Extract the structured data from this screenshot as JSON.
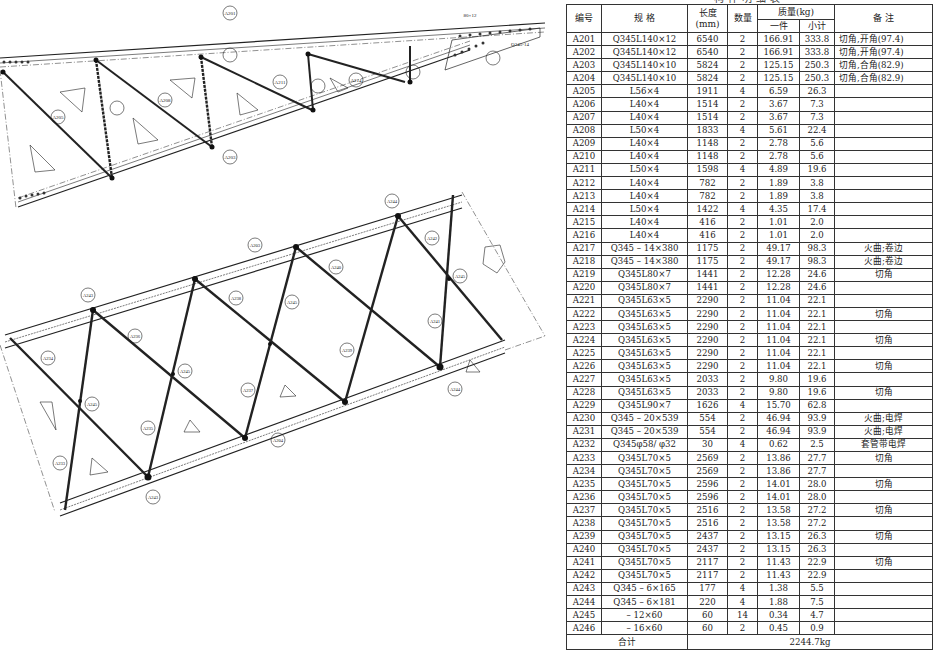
{
  "table": {
    "title": "构件明细表",
    "headers": {
      "id": "编号",
      "spec": "规  格",
      "length": "长度",
      "length_unit": "(mm)",
      "qty": "数量",
      "mass": "质量(kg)",
      "mass_each": "一件",
      "mass_subtotal": "小计",
      "note": "备  注"
    },
    "rows": [
      {
        "id": "A201",
        "spec": "Q345L140×12",
        "length": "6540",
        "qty": "2",
        "each": "166.91",
        "sub": "333.8",
        "note": "切角,开角(97.4)"
      },
      {
        "id": "A202",
        "spec": "Q345L140×12",
        "length": "6540",
        "qty": "2",
        "each": "166.91",
        "sub": "333.8",
        "note": "切角,开角(97.4)"
      },
      {
        "id": "A203",
        "spec": "Q345L140×10",
        "length": "5824",
        "qty": "2",
        "each": "125.15",
        "sub": "250.3",
        "note": "切角,合角(82.9)"
      },
      {
        "id": "A204",
        "spec": "Q345L140×10",
        "length": "5824",
        "qty": "2",
        "each": "125.15",
        "sub": "250.3",
        "note": "切角,合角(82.9)"
      },
      {
        "id": "A205",
        "spec": "L56×4",
        "length": "1911",
        "qty": "4",
        "each": "6.59",
        "sub": "26.3",
        "note": ""
      },
      {
        "id": "A206",
        "spec": "L40×4",
        "length": "1514",
        "qty": "2",
        "each": "3.67",
        "sub": "7.3",
        "note": ""
      },
      {
        "id": "A207",
        "spec": "L40×4",
        "length": "1514",
        "qty": "2",
        "each": "3.67",
        "sub": "7.3",
        "note": ""
      },
      {
        "id": "A208",
        "spec": "L50×4",
        "length": "1833",
        "qty": "4",
        "each": "5.61",
        "sub": "22.4",
        "note": ""
      },
      {
        "id": "A209",
        "spec": "L40×4",
        "length": "1148",
        "qty": "2",
        "each": "2.78",
        "sub": "5.6",
        "note": ""
      },
      {
        "id": "A210",
        "spec": "L40×4",
        "length": "1148",
        "qty": "2",
        "each": "2.78",
        "sub": "5.6",
        "note": ""
      },
      {
        "id": "A211",
        "spec": "L50×4",
        "length": "1598",
        "qty": "4",
        "each": "4.89",
        "sub": "19.6",
        "note": ""
      },
      {
        "id": "A212",
        "spec": "L40×4",
        "length": "782",
        "qty": "2",
        "each": "1.89",
        "sub": "3.8",
        "note": ""
      },
      {
        "id": "A213",
        "spec": "L40×4",
        "length": "782",
        "qty": "2",
        "each": "1.89",
        "sub": "3.8",
        "note": ""
      },
      {
        "id": "A214",
        "spec": "L50×4",
        "length": "1422",
        "qty": "4",
        "each": "4.35",
        "sub": "17.4",
        "note": ""
      },
      {
        "id": "A215",
        "spec": "L40×4",
        "length": "416",
        "qty": "2",
        "each": "1.01",
        "sub": "2.0",
        "note": ""
      },
      {
        "id": "A216",
        "spec": "L40×4",
        "length": "416",
        "qty": "2",
        "each": "1.01",
        "sub": "2.0",
        "note": ""
      },
      {
        "id": "A217",
        "spec": "Q345 – 14×380",
        "length": "1175",
        "qty": "2",
        "each": "49.17",
        "sub": "98.3",
        "note": "火曲;卷边"
      },
      {
        "id": "A218",
        "spec": "Q345 – 14×380",
        "length": "1175",
        "qty": "2",
        "each": "49.17",
        "sub": "98.3",
        "note": "火曲;卷边"
      },
      {
        "id": "A219",
        "spec": "Q345L80×7",
        "length": "1441",
        "qty": "2",
        "each": "12.28",
        "sub": "24.6",
        "note": "切角"
      },
      {
        "id": "A220",
        "spec": "Q345L80×7",
        "length": "1441",
        "qty": "2",
        "each": "12.28",
        "sub": "24.6",
        "note": ""
      },
      {
        "id": "A221",
        "spec": "Q345L63×5",
        "length": "2290",
        "qty": "2",
        "each": "11.04",
        "sub": "22.1",
        "note": ""
      },
      {
        "id": "A222",
        "spec": "Q345L63×5",
        "length": "2290",
        "qty": "2",
        "each": "11.04",
        "sub": "22.1",
        "note": "切角"
      },
      {
        "id": "A223",
        "spec": "Q345L63×5",
        "length": "2290",
        "qty": "2",
        "each": "11.04",
        "sub": "22.1",
        "note": ""
      },
      {
        "id": "A224",
        "spec": "Q345L63×5",
        "length": "2290",
        "qty": "2",
        "each": "11.04",
        "sub": "22.1",
        "note": "切角"
      },
      {
        "id": "A225",
        "spec": "Q345L63×5",
        "length": "2290",
        "qty": "2",
        "each": "11.04",
        "sub": "22.1",
        "note": ""
      },
      {
        "id": "A226",
        "spec": "Q345L63×5",
        "length": "2290",
        "qty": "2",
        "each": "11.04",
        "sub": "22.1",
        "note": "切角"
      },
      {
        "id": "A227",
        "spec": "Q345L63×5",
        "length": "2033",
        "qty": "2",
        "each": "9.80",
        "sub": "19.6",
        "note": ""
      },
      {
        "id": "A228",
        "spec": "Q345L63×5",
        "length": "2033",
        "qty": "2",
        "each": "9.80",
        "sub": "19.6",
        "note": "切角"
      },
      {
        "id": "A229",
        "spec": "Q345L90×7",
        "length": "1626",
        "qty": "4",
        "each": "15.70",
        "sub": "62.8",
        "note": ""
      },
      {
        "id": "A230",
        "spec": "Q345 – 20×539",
        "length": "554",
        "qty": "2",
        "each": "46.94",
        "sub": "93.9",
        "note": "火曲;电焊"
      },
      {
        "id": "A231",
        "spec": "Q345 – 20×539",
        "length": "554",
        "qty": "2",
        "each": "46.94",
        "sub": "93.9",
        "note": "火曲;电焊"
      },
      {
        "id": "A232",
        "spec": "Q345φ58/ φ32",
        "length": "30",
        "qty": "4",
        "each": "0.62",
        "sub": "2.5",
        "note": "套管带电焊"
      },
      {
        "id": "A233",
        "spec": "Q345L70×5",
        "length": "2569",
        "qty": "2",
        "each": "13.86",
        "sub": "27.7",
        "note": "切角"
      },
      {
        "id": "A234",
        "spec": "Q345L70×5",
        "length": "2569",
        "qty": "2",
        "each": "13.86",
        "sub": "27.7",
        "note": ""
      },
      {
        "id": "A235",
        "spec": "Q345L70×5",
        "length": "2596",
        "qty": "2",
        "each": "14.01",
        "sub": "28.0",
        "note": "切角"
      },
      {
        "id": "A236",
        "spec": "Q345L70×5",
        "length": "2596",
        "qty": "2",
        "each": "14.01",
        "sub": "28.0",
        "note": ""
      },
      {
        "id": "A237",
        "spec": "Q345L70×5",
        "length": "2516",
        "qty": "2",
        "each": "13.58",
        "sub": "27.2",
        "note": "切角"
      },
      {
        "id": "A238",
        "spec": "Q345L70×5",
        "length": "2516",
        "qty": "2",
        "each": "13.58",
        "sub": "27.2",
        "note": ""
      },
      {
        "id": "A239",
        "spec": "Q345L70×5",
        "length": "2437",
        "qty": "2",
        "each": "13.15",
        "sub": "26.3",
        "note": "切角"
      },
      {
        "id": "A240",
        "spec": "Q345L70×5",
        "length": "2437",
        "qty": "2",
        "each": "13.15",
        "sub": "26.3",
        "note": ""
      },
      {
        "id": "A241",
        "spec": "Q345L70×5",
        "length": "2117",
        "qty": "2",
        "each": "11.43",
        "sub": "22.9",
        "note": "切角"
      },
      {
        "id": "A242",
        "spec": "Q345L70×5",
        "length": "2117",
        "qty": "2",
        "each": "11.43",
        "sub": "22.9",
        "note": ""
      },
      {
        "id": "A243",
        "spec": "Q345 – 6×165",
        "length": "177",
        "qty": "4",
        "each": "1.38",
        "sub": "5.5",
        "note": ""
      },
      {
        "id": "A244",
        "spec": "Q345 – 6×181",
        "length": "220",
        "qty": "4",
        "each": "1.88",
        "sub": "7.5",
        "note": ""
      },
      {
        "id": "A245",
        "spec": "– 12×60",
        "length": "60",
        "qty": "14",
        "each": "0.34",
        "sub": "4.7",
        "note": ""
      },
      {
        "id": "A246",
        "spec": "– 16×60",
        "length": "60",
        "qty": "2",
        "each": "0.45",
        "sub": "0.9",
        "note": ""
      }
    ],
    "total_label": "合计",
    "total_value": "2244.7kg"
  },
  "drawing": {
    "upper_truss": {
      "labels": [
        "A201",
        "A202",
        "A203",
        "A204",
        "A205",
        "A206",
        "A207",
        "A208",
        "A209",
        "A210",
        "A211",
        "A212",
        "A213",
        "A214",
        "A215",
        "A216",
        "A217",
        "A218"
      ],
      "top_chord_note": "Q345L140×12",
      "top_chord_length": "6540",
      "bottom_chord_note": "Q345L140×10",
      "bottom_chord_length": "5824",
      "plate_dim": "80×12",
      "plate_spec": "Q345-14"
    },
    "lower_truss": {
      "labels": [
        "A203",
        "A204",
        "A233",
        "A234",
        "A235",
        "A236",
        "A237",
        "A238",
        "A239",
        "A240",
        "A241",
        "A242",
        "A243",
        "A244",
        "A245"
      ],
      "plate_spec": "Q345-6"
    }
  }
}
